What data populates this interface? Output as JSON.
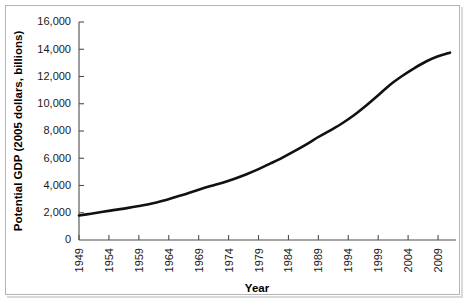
{
  "chart_data": {
    "type": "line",
    "title": "",
    "xlabel": "Year",
    "ylabel": "Potential GDP (2005 dollars, billions)",
    "xlim": [
      1949,
      2011
    ],
    "ylim": [
      0,
      16000
    ],
    "grid": false,
    "legend": "none",
    "line_color": "#111111",
    "axis_color": "#4d4d4d",
    "ytick_labels": [
      "0",
      "2,000",
      "4,000",
      "6,000",
      "8,000",
      "10,000",
      "12,000",
      "14,000",
      "16,000"
    ],
    "ytick_values": [
      0,
      2000,
      4000,
      6000,
      8000,
      10000,
      12000,
      14000,
      16000
    ],
    "xtick_labels": [
      "1949",
      "1954",
      "1959",
      "1964",
      "1969",
      "1974",
      "1979",
      "1984",
      "1989",
      "1994",
      "1999",
      "2004",
      "2009"
    ],
    "xtick_values": [
      1949,
      1954,
      1959,
      1964,
      1969,
      1974,
      1979,
      1984,
      1989,
      1994,
      1999,
      2004,
      2009
    ],
    "series": [
      {
        "name": "Potential GDP",
        "x": [
          1949,
          1951,
          1953,
          1955,
          1957,
          1959,
          1961,
          1963,
          1965,
          1967,
          1969,
          1971,
          1973,
          1975,
          1977,
          1979,
          1981,
          1983,
          1985,
          1987,
          1989,
          1991,
          1993,
          1995,
          1997,
          1999,
          2001,
          2003,
          2005,
          2007,
          2009,
          2011
        ],
        "values": [
          1800,
          1930,
          2070,
          2210,
          2340,
          2490,
          2660,
          2880,
          3140,
          3400,
          3690,
          3960,
          4210,
          4500,
          4830,
          5200,
          5620,
          6050,
          6520,
          7020,
          7560,
          8050,
          8570,
          9170,
          9870,
          10620,
          11400,
          12040,
          12600,
          13100,
          13480,
          13750
        ]
      }
    ]
  },
  "axis_titles": {
    "x": "Year",
    "y": "Potential GDP (2005 dollars, billions)"
  }
}
